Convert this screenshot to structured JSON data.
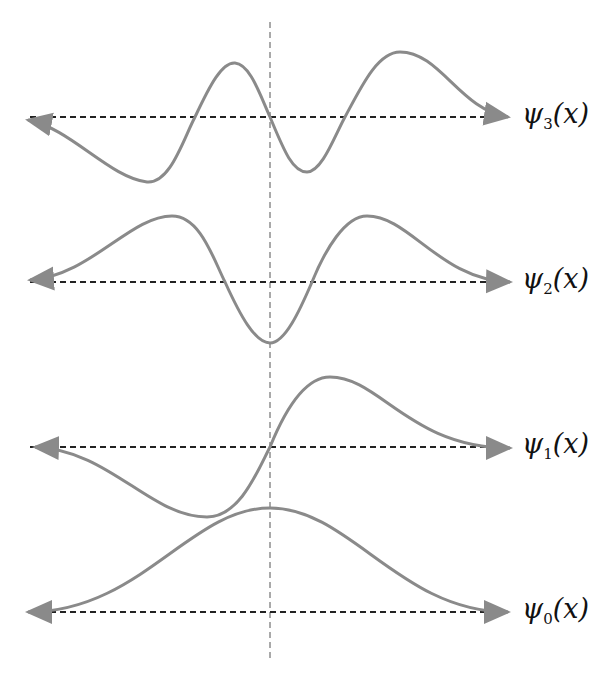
{
  "figure": {
    "center_line": {
      "x": 270,
      "y1": 22,
      "y2": 662
    },
    "colors": {
      "curve": "#8a8a8a",
      "axis": "#222222",
      "center_line": "#555555",
      "label": "#111111"
    },
    "wavefunctions": [
      {
        "id": "psi3",
        "label_base": "ψ",
        "label_sub": "3",
        "label_arg": "(x)",
        "axis_y": 117,
        "path": "M28,120 C70,128 110,178 147,182 C170,184 183,140 195,117 C210,85 222,62 235,63 C250,64 260,95 270,117 C283,148 292,172 307,172 C322,172 335,135 345,117 C362,85 378,52 400,52 C440,52 460,110 508,117"
      },
      {
        "id": "psi2",
        "label_base": "ψ",
        "label_sub": "2",
        "label_arg": "(x)",
        "axis_y": 282,
        "path": "M30,280 C90,276 130,216 172,216 C200,216 213,258 225,282 C240,315 255,343 270,343 C285,343 300,310 312,282 C325,250 345,216 367,216 C410,216 440,280 510,282"
      },
      {
        "id": "psi1",
        "label_base": "ψ",
        "label_sub": "1",
        "label_arg": "(x)",
        "axis_y": 447,
        "path": "M35,447 C110,450 150,517 207,517 C240,517 258,470 270,447 C285,410 305,377 330,377 C380,377 410,448 510,448"
      },
      {
        "id": "psi0",
        "label_base": "ψ",
        "label_sub": "0",
        "label_arg": "(x)",
        "axis_y": 612,
        "path": "M28,612 C140,612 190,508 270,508 C350,508 400,612 508,612"
      }
    ]
  },
  "chart_data": {
    "type": "line",
    "title": "",
    "xlabel": "x",
    "ylabel": "",
    "series": [
      {
        "name": "ψ3(x)",
        "description": "odd, 3 nodes",
        "extrema": [
          {
            "x": -0.52,
            "y": -1.0
          },
          {
            "x": -0.15,
            "y": 0.9
          },
          {
            "x": 0.16,
            "y": -0.9
          },
          {
            "x": 0.55,
            "y": 1.0
          }
        ]
      },
      {
        "name": "ψ2(x)",
        "description": "even, 2 nodes",
        "extrema": [
          {
            "x": -0.42,
            "y": 1.0
          },
          {
            "x": 0.0,
            "y": -0.9
          },
          {
            "x": 0.42,
            "y": 1.0
          }
        ]
      },
      {
        "name": "ψ1(x)",
        "description": "odd, 1 node",
        "extrema": [
          {
            "x": -0.27,
            "y": -1.0
          },
          {
            "x": 0.26,
            "y": 1.0
          }
        ]
      },
      {
        "name": "ψ0(x)",
        "description": "even, Gaussian, 0 nodes",
        "extrema": [
          {
            "x": 0.0,
            "y": 1.0
          }
        ]
      }
    ],
    "grid": false,
    "annotations": [
      "vertical dashed line at x=0",
      "dashed horizontal axis per curve"
    ]
  }
}
